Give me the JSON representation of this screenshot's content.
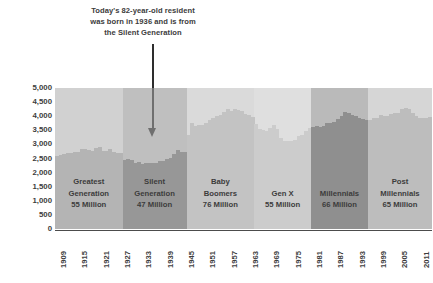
{
  "annotation": {
    "lines": [
      "Today's 82-year-old resident",
      "was born in 1936 and is from",
      "the Silent Generation"
    ],
    "arrow_name": "down-arrow-pointer",
    "points_to_year": 1936
  },
  "axes": {
    "y_ticks": [
      "5,000",
      "4,500",
      "4,000",
      "3,500",
      "3,000",
      "2,500",
      "2,000",
      "1,500",
      "1,000",
      "500",
      "0"
    ],
    "y_tick_values": [
      5000,
      4500,
      4000,
      3500,
      3000,
      2500,
      2000,
      1500,
      1000,
      500,
      0
    ],
    "x_ticks": [
      "1909",
      "1915",
      "1921",
      "1927",
      "1933",
      "1939",
      "1945",
      "1951",
      "1957",
      "1963",
      "1969",
      "1975",
      "1981",
      "1987",
      "1993",
      "1999",
      "2005",
      "2011"
    ],
    "x_tick_values": [
      1909,
      1915,
      1921,
      1927,
      1933,
      1939,
      1945,
      1951,
      1957,
      1963,
      1969,
      1975,
      1981,
      1987,
      1993,
      1999,
      2005,
      2011
    ]
  },
  "generations": [
    {
      "name_lines": [
        "Greatest",
        "Generation"
      ],
      "size_label": "55 Million",
      "start_year": 1909,
      "end_year": 1927,
      "color": "#b4b4b4"
    },
    {
      "name_lines": [
        "Silent",
        "Generation"
      ],
      "size_label": "47 Million",
      "start_year": 1928,
      "end_year": 1945,
      "color": "#979797"
    },
    {
      "name_lines": [
        "Baby",
        "Boomers"
      ],
      "size_label": "76 Million",
      "start_year": 1946,
      "end_year": 1964,
      "color": "#c3c3c3"
    },
    {
      "name_lines": [
        "Gen X"
      ],
      "size_label": "55 Million",
      "start_year": 1965,
      "end_year": 1980,
      "color": "#cccccc"
    },
    {
      "name_lines": [
        "Millennials"
      ],
      "size_label": "66 Million",
      "start_year": 1981,
      "end_year": 1996,
      "color": "#8f8f8f"
    },
    {
      "name_lines": [
        "Post",
        "Millennials"
      ],
      "size_label": "65 Million",
      "start_year": 1997,
      "end_year": 2014,
      "color": "#bdbdbd"
    }
  ],
  "chart_data": {
    "type": "bar",
    "title": "",
    "subtitle": "",
    "xlabel": "",
    "ylabel": "",
    "ylim": [
      0,
      5000
    ],
    "xlim": [
      1909,
      2014
    ],
    "grid": false,
    "legend": "none",
    "unit": "thousands of residents",
    "x": [
      1909,
      1910,
      1911,
      1912,
      1913,
      1914,
      1915,
      1916,
      1917,
      1918,
      1919,
      1920,
      1921,
      1922,
      1923,
      1924,
      1925,
      1926,
      1927,
      1928,
      1929,
      1930,
      1931,
      1932,
      1933,
      1934,
      1935,
      1936,
      1937,
      1938,
      1939,
      1940,
      1941,
      1942,
      1943,
      1944,
      1945,
      1946,
      1947,
      1948,
      1949,
      1950,
      1951,
      1952,
      1953,
      1954,
      1955,
      1956,
      1957,
      1958,
      1959,
      1960,
      1961,
      1962,
      1963,
      1964,
      1965,
      1966,
      1967,
      1968,
      1969,
      1970,
      1971,
      1972,
      1973,
      1974,
      1975,
      1976,
      1977,
      1978,
      1979,
      1980,
      1981,
      1982,
      1983,
      1984,
      1985,
      1986,
      1987,
      1988,
      1989,
      1990,
      1991,
      1992,
      1993,
      1994,
      1995,
      1996,
      1997,
      1998,
      1999,
      2000,
      2001,
      2002,
      2003,
      2004,
      2005,
      2006,
      2007,
      2008,
      2009,
      2010,
      2011,
      2012,
      2013,
      2014
    ],
    "values": [
      2600,
      2620,
      2650,
      2680,
      2700,
      2720,
      2740,
      2820,
      2840,
      2810,
      2760,
      2870,
      2900,
      2780,
      2760,
      2830,
      2740,
      2710,
      2690,
      2430,
      2480,
      2450,
      2330,
      2380,
      2300,
      2350,
      2340,
      2330,
      2350,
      2400,
      2420,
      2470,
      2520,
      2660,
      2790,
      2740,
      2720,
      3350,
      3760,
      3640,
      3700,
      3690,
      3770,
      3850,
      3930,
      4020,
      4040,
      4160,
      4250,
      4180,
      4240,
      4230,
      4200,
      4080,
      4030,
      3980,
      3740,
      3550,
      3500,
      3490,
      3570,
      3680,
      3530,
      3210,
      3120,
      3130,
      3130,
      3150,
      3300,
      3320,
      3460,
      3590,
      3620,
      3660,
      3600,
      3650,
      3750,
      3750,
      3800,
      3900,
      4020,
      4150,
      4100,
      4060,
      4000,
      3940,
      3890,
      3880,
      3870,
      3930,
      3950,
      4050,
      4020,
      4010,
      4080,
      4110,
      4130,
      4260,
      4300,
      4240,
      4130,
      4000,
      3950,
      3950,
      3930,
      3980
    ],
    "bands": [
      {
        "label": "Greatest Generation",
        "size_millions": 55,
        "years": [
          1909,
          1927
        ]
      },
      {
        "label": "Silent Generation",
        "size_millions": 47,
        "years": [
          1928,
          1945
        ]
      },
      {
        "label": "Baby Boomers",
        "size_millions": 76,
        "years": [
          1946,
          1964
        ]
      },
      {
        "label": "Gen X",
        "size_millions": 55,
        "years": [
          1965,
          1980
        ]
      },
      {
        "label": "Millennials",
        "size_millions": 66,
        "years": [
          1981,
          1996
        ]
      },
      {
        "label": "Post Millennials",
        "size_millions": 65,
        "years": [
          1997,
          2014
        ]
      }
    ],
    "annotations": [
      {
        "text": "Today's 82-year-old resident was born in 1936 and is from the Silent Generation",
        "at_year": 1936
      }
    ]
  }
}
